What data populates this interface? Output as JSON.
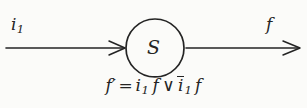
{
  "figure": {
    "type": "state-transition-diagram",
    "background_color": "#fbfbf9",
    "ink_color": "#242424",
    "input": {
      "label_base": "i",
      "label_subscript": "1",
      "arrow_direction": "right"
    },
    "state_node": {
      "shape": "circle",
      "label": "S",
      "center_x": 155,
      "center_y": 48,
      "radius": 29
    },
    "output": {
      "label_base": "f",
      "arrow_direction": "right"
    },
    "equation": {
      "lhs_base": "f",
      "lhs_prime": "′",
      "equals": "=",
      "term1_var": "i",
      "term1_sub": "1",
      "term1_neg": "f",
      "or_operator": "∨",
      "term2_neg": "i",
      "term2_sub": "1",
      "term2_var": "f",
      "plain_text": "f′ = i₁ f̄ ∨ ī₁ f"
    }
  }
}
